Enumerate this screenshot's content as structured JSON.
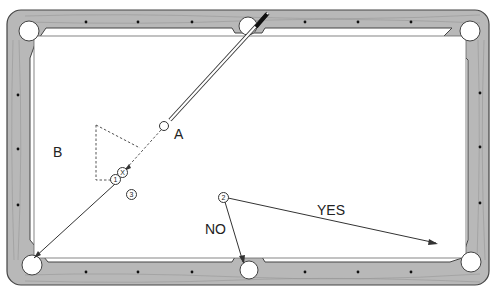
{
  "diagram": {
    "type": "pool-table-shot-diagram",
    "colors": {
      "rail_wood": "#b8b8b8",
      "rail_outline": "#555555",
      "cloth": "#ffffff",
      "line": "#333333",
      "cue_tip": "#111111"
    },
    "labels": {
      "A": "A",
      "B": "B",
      "yes": "YES",
      "no": "NO"
    },
    "markers": {
      "ball_1": "1",
      "ball_2": "2",
      "ball_3": "3",
      "ghost_x": "X"
    },
    "pockets": [
      "top-left",
      "top-center",
      "top-right",
      "bottom-left",
      "bottom-center",
      "bottom-right"
    ],
    "paths": [
      {
        "name": "cue-stick",
        "from": [
          250,
          15
        ],
        "to": [
          166,
          122
        ]
      },
      {
        "name": "cue-ball-path",
        "from": [
          164,
          126
        ],
        "to": [
          122,
          172
        ],
        "style": "dashed"
      },
      {
        "name": "object-ball-path",
        "from": [
          116,
          180
        ],
        "to": [
          28,
          262
        ]
      },
      {
        "name": "yes-path",
        "from": [
          224,
          198
        ],
        "to": [
          437,
          244
        ]
      },
      {
        "name": "no-path",
        "from": [
          224,
          198
        ],
        "to": [
          243,
          264
        ]
      }
    ]
  }
}
